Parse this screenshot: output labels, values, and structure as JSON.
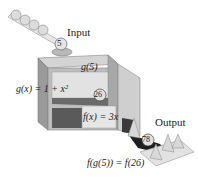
{
  "diagram": {
    "type": "function-composition-machine",
    "labels": {
      "input": "Input",
      "output": "Output",
      "g_of_5": "g(5)",
      "g_def": "g(x) = 1 + x²",
      "f_def": "f(x) = 3x",
      "composition": "f(g(5)) = f(26)"
    },
    "balls": {
      "input_value": "5",
      "intermediate_value": "26",
      "output_value": "78"
    },
    "colors": {
      "box": "#c8c8c8",
      "box_dark": "#8a8a8a",
      "box_inner": "#5a5a5a",
      "ball": "#d8d8d8",
      "tray": "#e0e0e0",
      "chute": "#222222"
    }
  }
}
